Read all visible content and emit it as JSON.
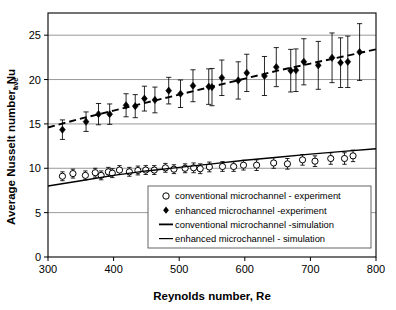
{
  "chart_data": {
    "type": "scatter",
    "title": "",
    "xlabel": "Reynolds number, Re",
    "ylabel": "Average Nusselt number, Nu",
    "ylabel_subscript": "ave",
    "xlim": [
      300,
      800
    ],
    "ylim": [
      0,
      27.5
    ],
    "xticks": [
      300,
      400,
      500,
      600,
      700,
      800
    ],
    "yticks": [
      0,
      5,
      10,
      15,
      20,
      25
    ],
    "grid": "horizontal",
    "legend_position": "lower-right-inside",
    "series": [
      {
        "name": "conventional microchannel - experiment",
        "marker": "open-circle",
        "type": "scatter-errorbar",
        "points": [
          {
            "x": 322,
            "y": 9.1,
            "err": 0.5
          },
          {
            "x": 338,
            "y": 9.4,
            "err": 0.5
          },
          {
            "x": 357,
            "y": 9.2,
            "err": 0.5
          },
          {
            "x": 372,
            "y": 9.5,
            "err": 0.5
          },
          {
            "x": 381,
            "y": 9.2,
            "err": 0.5
          },
          {
            "x": 392,
            "y": 9.6,
            "err": 0.5
          },
          {
            "x": 398,
            "y": 9.45,
            "err": 0.5
          },
          {
            "x": 409,
            "y": 9.8,
            "err": 0.5
          },
          {
            "x": 424,
            "y": 9.6,
            "err": 0.5
          },
          {
            "x": 437,
            "y": 9.75,
            "err": 0.5
          },
          {
            "x": 449,
            "y": 9.8,
            "err": 0.5
          },
          {
            "x": 462,
            "y": 9.8,
            "err": 0.5
          },
          {
            "x": 479,
            "y": 10.05,
            "err": 0.5
          },
          {
            "x": 492,
            "y": 9.9,
            "err": 0.5
          },
          {
            "x": 509,
            "y": 10.0,
            "err": 0.5
          },
          {
            "x": 522,
            "y": 10.05,
            "err": 0.55
          },
          {
            "x": 532,
            "y": 9.95,
            "err": 0.55
          },
          {
            "x": 546,
            "y": 10.15,
            "err": 0.55
          },
          {
            "x": 566,
            "y": 10.2,
            "err": 0.55
          },
          {
            "x": 583,
            "y": 10.2,
            "err": 0.55
          },
          {
            "x": 598,
            "y": 10.35,
            "err": 0.55
          },
          {
            "x": 618,
            "y": 10.35,
            "err": 0.6
          },
          {
            "x": 644,
            "y": 10.6,
            "err": 0.6
          },
          {
            "x": 665,
            "y": 10.5,
            "err": 0.6
          },
          {
            "x": 688,
            "y": 10.95,
            "err": 0.6
          },
          {
            "x": 707,
            "y": 10.8,
            "err": 0.6
          },
          {
            "x": 731,
            "y": 11.1,
            "err": 0.65
          },
          {
            "x": 752,
            "y": 11.1,
            "err": 0.65
          },
          {
            "x": 765,
            "y": 11.4,
            "err": 0.65
          }
        ]
      },
      {
        "name": "enhanced microchannel -experiment",
        "marker": "filled-diamond",
        "type": "scatter-errorbar",
        "points": [
          {
            "x": 322,
            "y": 14.35,
            "err": 1.1
          },
          {
            "x": 358,
            "y": 15.25,
            "err": 1.1
          },
          {
            "x": 377,
            "y": 16.1,
            "err": 1.2
          },
          {
            "x": 394,
            "y": 16.1,
            "err": 1.15
          },
          {
            "x": 419,
            "y": 17.1,
            "err": 1.3
          },
          {
            "x": 433,
            "y": 17.0,
            "err": 1.3
          },
          {
            "x": 447,
            "y": 17.85,
            "err": 1.4
          },
          {
            "x": 463,
            "y": 17.7,
            "err": 1.45
          },
          {
            "x": 484,
            "y": 18.75,
            "err": 1.5
          },
          {
            "x": 502,
            "y": 18.4,
            "err": 1.55
          },
          {
            "x": 521,
            "y": 19.3,
            "err": 1.8
          },
          {
            "x": 545,
            "y": 19.2,
            "err": 2.0
          },
          {
            "x": 550,
            "y": 19.15,
            "err": 2.1
          },
          {
            "x": 565,
            "y": 20.2,
            "err": 2.0
          },
          {
            "x": 590,
            "y": 19.9,
            "err": 2.1
          },
          {
            "x": 603,
            "y": 20.75,
            "err": 2.1
          },
          {
            "x": 630,
            "y": 20.4,
            "err": 2.2
          },
          {
            "x": 648,
            "y": 21.4,
            "err": 2.2
          },
          {
            "x": 670,
            "y": 21.0,
            "err": 2.4
          },
          {
            "x": 678,
            "y": 21.05,
            "err": 2.4
          },
          {
            "x": 690,
            "y": 22.0,
            "err": 2.6
          },
          {
            "x": 712,
            "y": 21.6,
            "err": 2.7
          },
          {
            "x": 733,
            "y": 22.45,
            "err": 2.8
          },
          {
            "x": 746,
            "y": 21.9,
            "err": 2.8
          },
          {
            "x": 757,
            "y": 22.0,
            "err": 2.9
          },
          {
            "x": 775,
            "y": 23.1,
            "err": 3.2
          }
        ]
      },
      {
        "name": "conventional microchannel -simulation",
        "type": "line",
        "style": "dashed",
        "points": [
          {
            "x": 300,
            "y": 14.6
          },
          {
            "x": 350,
            "y": 15.6
          },
          {
            "x": 400,
            "y": 16.5
          },
          {
            "x": 450,
            "y": 17.4
          },
          {
            "x": 500,
            "y": 18.3
          },
          {
            "x": 550,
            "y": 19.2
          },
          {
            "x": 600,
            "y": 20.1
          },
          {
            "x": 650,
            "y": 21.0
          },
          {
            "x": 700,
            "y": 21.8
          },
          {
            "x": 750,
            "y": 22.6
          },
          {
            "x": 800,
            "y": 23.4
          }
        ]
      },
      {
        "name": "enhanced microchannel - simulation",
        "type": "line",
        "style": "solid",
        "points": [
          {
            "x": 300,
            "y": 8.0
          },
          {
            "x": 350,
            "y": 8.6
          },
          {
            "x": 400,
            "y": 9.2
          },
          {
            "x": 450,
            "y": 9.7
          },
          {
            "x": 500,
            "y": 10.1
          },
          {
            "x": 550,
            "y": 10.5
          },
          {
            "x": 600,
            "y": 10.9
          },
          {
            "x": 650,
            "y": 11.25
          },
          {
            "x": 700,
            "y": 11.6
          },
          {
            "x": 750,
            "y": 11.9
          },
          {
            "x": 800,
            "y": 12.2
          }
        ]
      }
    ],
    "legend_entries": [
      {
        "label": "conventional microchannel - experiment",
        "symbol": "open-circle"
      },
      {
        "label": "enhanced microchannel -experiment",
        "symbol": "filled-diamond"
      },
      {
        "label": "conventional microchannel -simulation",
        "symbol": "line-thick"
      },
      {
        "label": "enhanced microchannel - simulation",
        "symbol": "line-thin"
      }
    ]
  },
  "colors": {
    "axis": "#000000",
    "grid": "#808080",
    "marker": "#000000",
    "background": "#ffffff"
  }
}
